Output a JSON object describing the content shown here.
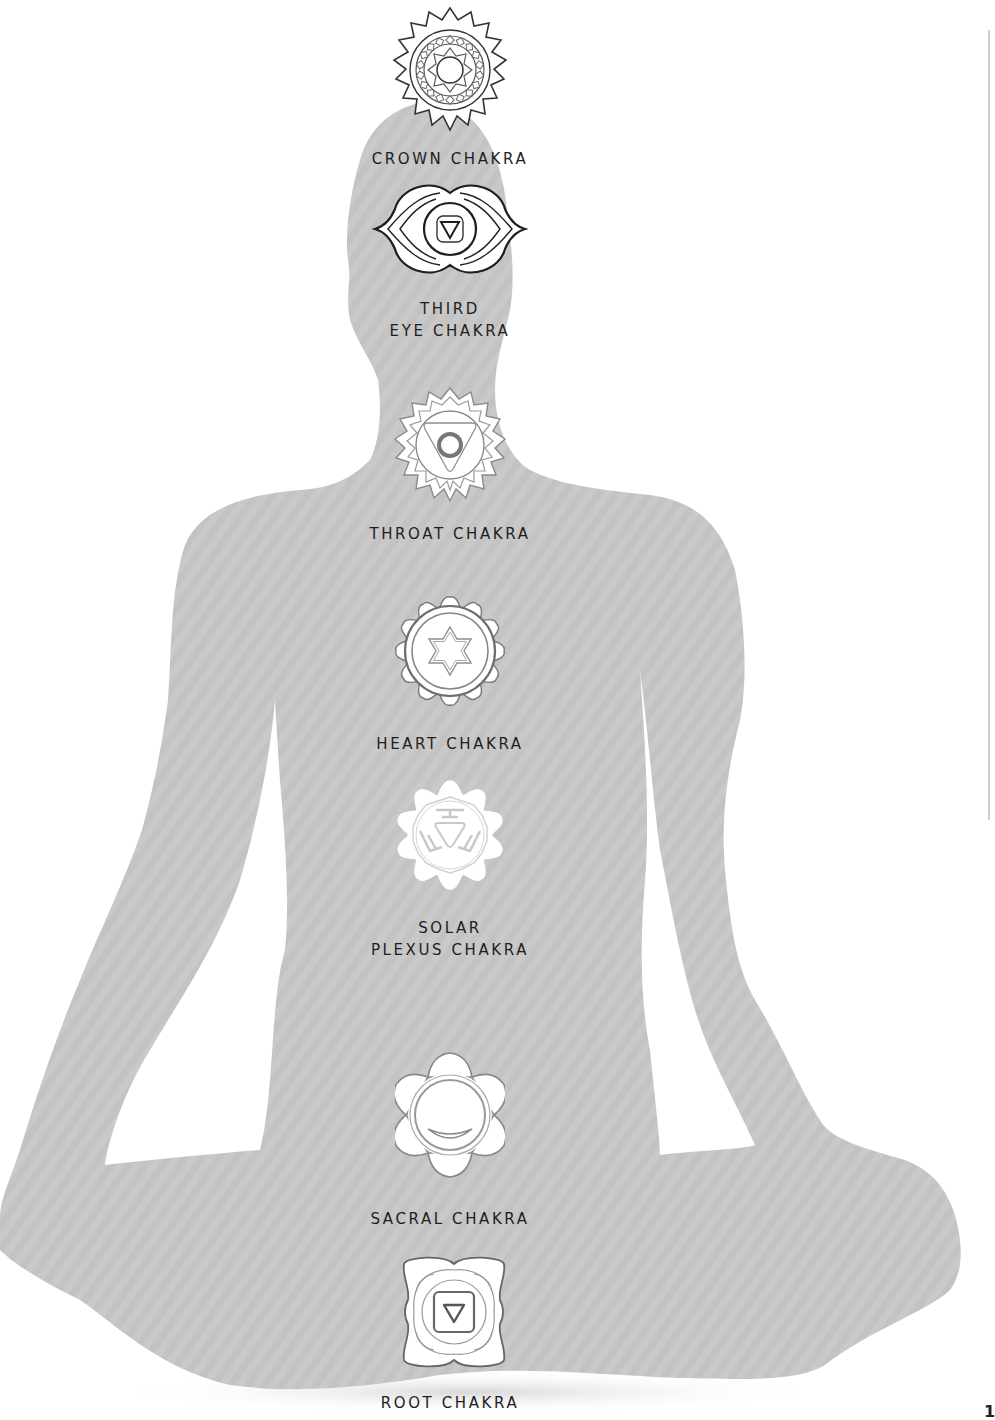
{
  "figure": {
    "silhouette_color": "#c9c9c9",
    "background_color": "#ffffff",
    "outline_colors": {
      "dark": "#2a2a2a",
      "medium": "#6e6e6e",
      "light": "#a8a8a8"
    }
  },
  "chakras": [
    {
      "id": "crown",
      "label": "CROWN CHAKRA",
      "symbol": "thousand-petal-lotus-icon"
    },
    {
      "id": "third-eye",
      "label_line1": "THIRD",
      "label_line2": "EYE CHAKRA",
      "symbol": "two-petal-eye-icon"
    },
    {
      "id": "throat",
      "label": "THROAT CHAKRA",
      "symbol": "sixteen-petal-triangle-circle-icon"
    },
    {
      "id": "heart",
      "label": "HEART CHAKRA",
      "symbol": "twelve-petal-hexagram-icon"
    },
    {
      "id": "solar-plexus",
      "label_line1": "SOLAR",
      "label_line2": "PLEXUS CHAKRA",
      "symbol": "ten-petal-triangle-icon"
    },
    {
      "id": "sacral",
      "label": "SACRAL CHAKRA",
      "symbol": "six-petal-crescent-icon"
    },
    {
      "id": "root",
      "label": "ROOT CHAKRA",
      "symbol": "four-petal-square-triangle-icon"
    }
  ],
  "page": {
    "number": "1"
  }
}
